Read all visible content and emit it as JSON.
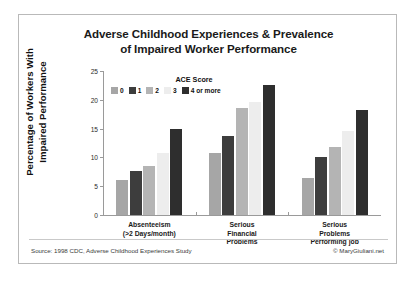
{
  "chart_data": {
    "type": "bar",
    "title": "Adverse Childhood Experiences & Prevalence of Impaired Worker Performance",
    "title_line1": "Adverse Childhood Experiences & Prevalence",
    "title_line2": "of Impaired Worker Performance",
    "ylabel": "Percentage of Workers With Impaired Performance",
    "ylabel_line1": "Percentage of Workers With",
    "ylabel_line2": "Impaired  Performance",
    "xlabel": "",
    "ylim": [
      0,
      25
    ],
    "yticks": [
      0,
      5,
      10,
      15,
      20,
      25
    ],
    "ytick_labels": [
      "0",
      "5",
      "10",
      "15",
      "20",
      "25"
    ],
    "grid": false,
    "legend_position": "top-center-inside",
    "legend_title": "ACE Score",
    "categories": [
      "Absenteeism (>2 Days/month)",
      "Serious Financial Problems",
      "Serious Problems Performing job"
    ],
    "category_lines": [
      [
        "Absenteeism",
        "(>2 Days/month)"
      ],
      [
        "Serious",
        "Financial",
        "Problems"
      ],
      [
        "Serious",
        "Problems",
        "Performing job"
      ]
    ],
    "series": [
      {
        "name": "0",
        "color": "#a6a6a6",
        "values": [
          6.0,
          10.7,
          6.4
        ]
      },
      {
        "name": "1",
        "color": "#3d3d3d",
        "values": [
          7.6,
          13.7,
          10.0
        ]
      },
      {
        "name": "2",
        "color": "#b4b4b4",
        "values": [
          8.5,
          18.6,
          11.8
        ]
      },
      {
        "name": "3",
        "color": "#ededed",
        "values": [
          10.8,
          19.7,
          14.5
        ]
      },
      {
        "name": "4 or more",
        "color": "#2e2e2e",
        "values": [
          14.9,
          22.6,
          18.2
        ]
      }
    ],
    "source_note": "Source: 1998 CDC, Adverse Childhood Experiences Study",
    "copyright": "© MaryGiuliani.net"
  }
}
